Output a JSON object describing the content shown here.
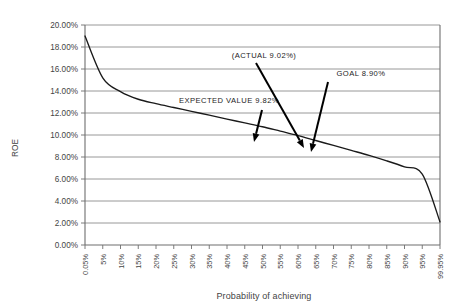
{
  "chart_data": {
    "type": "line",
    "title": "",
    "xlabel": "Probability of achieving",
    "ylabel": "ROE",
    "grid": true,
    "legend": "none",
    "ylim": [
      0,
      20
    ],
    "y_tick_labels": [
      "0.00%",
      "2.00%",
      "4.00%",
      "6.00%",
      "8.00%",
      "10.00%",
      "12.00%",
      "14.00%",
      "16.00%",
      "18.00%",
      "20.00%"
    ],
    "y_tick_values": [
      0,
      2,
      4,
      6,
      8,
      10,
      12,
      14,
      16,
      18,
      20
    ],
    "x_tick_labels": [
      "0.05%",
      "5%",
      "10%",
      "15%",
      "20%",
      "25%",
      "30%",
      "35%",
      "40%",
      "45%",
      "50%",
      "55%",
      "60%",
      "65%",
      "70%",
      "75%",
      "80%",
      "85%",
      "90%",
      "95%",
      "99.95%"
    ],
    "categories": [
      "0.05%",
      "5%",
      "10%",
      "15%",
      "20%",
      "25%",
      "30%",
      "35%",
      "40%",
      "45%",
      "50%",
      "55%",
      "60%",
      "65%",
      "70%",
      "75%",
      "80%",
      "85%",
      "90%",
      "95%",
      "99.95%"
    ],
    "series": [
      {
        "name": "ROE distribution",
        "values": [
          19.0,
          15.2,
          13.95,
          13.25,
          12.85,
          12.5,
          12.15,
          11.8,
          11.45,
          11.1,
          10.75,
          10.35,
          9.95,
          9.5,
          9.05,
          8.6,
          8.15,
          7.65,
          7.1,
          6.45,
          2.1
        ]
      }
    ],
    "annotations": [
      {
        "id": "expected-value",
        "label": "EXPECTED VALUE 9.82%",
        "value": 9.82,
        "text_x": 229,
        "text_y": 103,
        "arrow_from_x": 262,
        "arrow_from_y": 110,
        "arrow_to_x": 254,
        "arrow_to_y": 142
      },
      {
        "id": "actual",
        "label": "(ACTUAL 9.02%)",
        "value": 9.02,
        "text_x": 264,
        "text_y": 58,
        "arrow_from_x": 256,
        "arrow_from_y": 63,
        "arrow_to_x": 304,
        "arrow_to_y": 148
      },
      {
        "id": "goal",
        "label": "GOAL 8.90%",
        "value": 8.9,
        "text_x": 361,
        "text_y": 76,
        "arrow_from_x": 328,
        "arrow_from_y": 82,
        "arrow_to_x": 311,
        "arrow_to_y": 152
      }
    ]
  },
  "colors": {
    "series_line": "#1a1a1a",
    "gridline": "#8c8c8c",
    "axis": "#6e6e6e",
    "text": "#444444",
    "annotation_text": "#1d1d1d",
    "background": "#ffffff"
  }
}
